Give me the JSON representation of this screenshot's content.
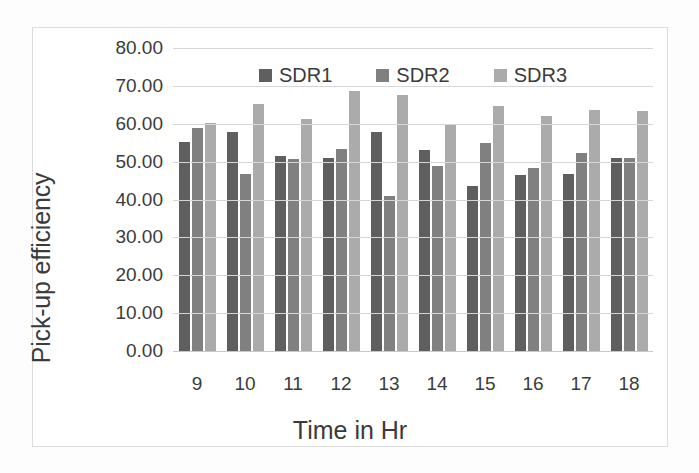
{
  "chart_data": {
    "type": "bar",
    "title": "",
    "xlabel": "Time in Hr",
    "ylabel": "Pick-up efficiency",
    "categories": [
      "9",
      "10",
      "11",
      "12",
      "13",
      "14",
      "15",
      "16",
      "17",
      "18"
    ],
    "series": [
      {
        "name": "SDR1",
        "color": "#5f5f5f",
        "values": [
          55.2,
          57.7,
          51.4,
          50.9,
          57.8,
          53.1,
          43.6,
          46.5,
          46.7,
          50.9
        ]
      },
      {
        "name": "SDR2",
        "color": "#808080",
        "values": [
          58.8,
          46.7,
          50.6,
          53.4,
          40.8,
          48.9,
          54.8,
          48.3,
          52.2,
          50.9
        ]
      },
      {
        "name": "SDR3",
        "color": "#ababab",
        "values": [
          60.3,
          65.2,
          61.2,
          68.6,
          67.7,
          59.8,
          64.8,
          62.0,
          63.6,
          63.5
        ]
      }
    ],
    "ylim": [
      0,
      80
    ],
    "ytick_step": 10,
    "ytick_labels": [
      "80.00",
      "70.00",
      "60.00",
      "50.00",
      "40.00",
      "30.00",
      "20.00",
      "10.00",
      "0.00"
    ],
    "grid": true,
    "legend_position": "top-center"
  }
}
